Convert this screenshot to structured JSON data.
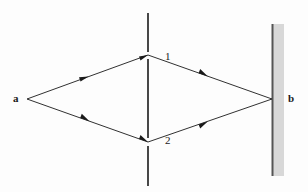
{
  "figure": {
    "name": "double-slit-interference-diagram",
    "background_color": "#fdfdfd",
    "width": 308,
    "height": 192,
    "labels": {
      "source": "a",
      "detector": "b",
      "slit_upper": "1",
      "slit_lower": "2"
    },
    "colors": {
      "ray": "#1a1a1a",
      "barrier": "#1a1a1a",
      "screen_line": "#555555",
      "screen_band": "#d8d8d8",
      "text": "#1a1a1a"
    },
    "geometry": {
      "source_point": {
        "x": 27,
        "y": 99
      },
      "detector_point": {
        "x": 272,
        "y": 99
      },
      "slit_upper_point": {
        "x": 148,
        "y": 55
      },
      "slit_lower_point": {
        "x": 148,
        "y": 142
      },
      "barrier_x": 148,
      "barrier_top_segment": {
        "y1": 13,
        "y2": 52
      },
      "barrier_mid_segment": {
        "y1": 59,
        "y2": 138
      },
      "barrier_bottom_segment": {
        "y1": 146,
        "y2": 186
      },
      "screen_line_x": 272,
      "screen_top": 24,
      "screen_bottom": 176,
      "screen_band_left": 272,
      "screen_band_right": 284
    },
    "paths": [
      {
        "id": "path-a-to-1",
        "from": "a",
        "to": "1",
        "arrow_at": {
          "x": 84,
          "y": 78
        }
      },
      {
        "id": "path-a-to-2",
        "from": "a",
        "to": "2",
        "arrow_at": {
          "x": 85,
          "y": 120
        }
      },
      {
        "id": "path-1-to-b",
        "from": "1",
        "to": "b",
        "arrow_at": {
          "x": 203,
          "y": 73
        }
      },
      {
        "id": "path-2-to-b",
        "from": "2",
        "to": "b",
        "arrow_at": {
          "x": 203,
          "y": 126
        }
      }
    ]
  }
}
